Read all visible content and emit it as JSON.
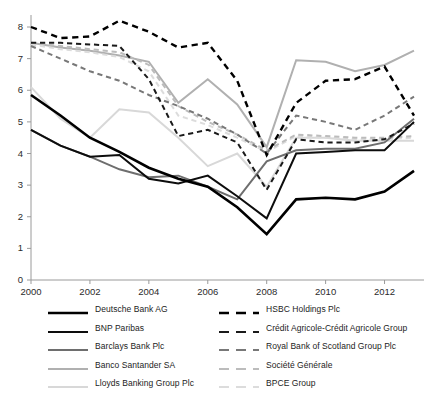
{
  "chart_data": {
    "type": "line",
    "title": "",
    "subtitle": "",
    "xlabel": "",
    "ylabel": "",
    "xlim": [
      2000,
      2013
    ],
    "ylim": [
      0,
      8
    ],
    "x": [
      2000,
      2001,
      2002,
      2003,
      2004,
      2005,
      2006,
      2007,
      2008,
      2009,
      2010,
      2011,
      2012,
      2013
    ],
    "x_ticks": [
      2000,
      2002,
      2004,
      2006,
      2008,
      2010,
      2012
    ],
    "x_tick_labels": [
      "2000",
      "2002",
      "2004",
      "2006",
      "2008",
      "2010",
      "2012"
    ],
    "y_ticks": [
      0,
      1,
      2,
      3,
      4,
      5,
      6,
      7,
      8
    ],
    "y_tick_labels": [
      "0",
      "1",
      "2",
      "3",
      "4",
      "5",
      "6",
      "7",
      "8"
    ],
    "grid": false,
    "legend_position": "below",
    "legend_columns": 2,
    "series": [
      {
        "name": "Deutsche Bank AG",
        "color": "#000000",
        "width": 2.6,
        "dash": "solid",
        "values": [
          5.85,
          5.2,
          4.5,
          4.05,
          3.55,
          3.2,
          2.95,
          2.3,
          1.45,
          2.55,
          2.6,
          2.55,
          2.8,
          3.45
        ]
      },
      {
        "name": "BNP Paribas",
        "color": "#0d0d0d",
        "width": 2.0,
        "dash": "solid",
        "values": [
          4.75,
          4.25,
          3.9,
          3.95,
          3.2,
          3.05,
          3.3,
          2.65,
          1.95,
          4.0,
          4.05,
          4.1,
          4.1,
          5.0
        ]
      },
      {
        "name": "Barclays Bank Plc",
        "color": "#6e6e6e",
        "width": 2.0,
        "dash": "solid",
        "values": [
          4.75,
          4.25,
          3.9,
          3.5,
          3.25,
          3.3,
          2.95,
          2.55,
          3.75,
          4.1,
          4.15,
          4.15,
          4.35,
          5.1
        ]
      },
      {
        "name": "Banco Santander SA",
        "color": "#b0b0b0",
        "width": 2.0,
        "dash": "solid",
        "values": [
          7.5,
          7.35,
          7.25,
          7.1,
          6.9,
          5.6,
          6.35,
          5.55,
          4.2,
          6.95,
          6.9,
          6.6,
          6.8,
          7.25
        ]
      },
      {
        "name": "Lloyds Banking Group Plc",
        "color": "#d8d8d8",
        "width": 2.0,
        "dash": "solid",
        "values": [
          6.1,
          5.1,
          4.5,
          5.4,
          5.3,
          4.5,
          3.6,
          4.0,
          2.95,
          4.5,
          4.5,
          4.4,
          4.4,
          4.4
        ]
      },
      {
        "name": "HSBC Holdings Plc",
        "color": "#000000",
        "width": 2.4,
        "dash": "dashed",
        "values": [
          8.0,
          7.65,
          7.7,
          8.2,
          7.85,
          7.35,
          7.5,
          6.3,
          3.95,
          5.6,
          6.3,
          6.35,
          6.75,
          5.2
        ]
      },
      {
        "name": "Crédit Agricole-Crédit Agricole Group",
        "color": "#1a1a1a",
        "width": 2.0,
        "dash": "dashed",
        "values": [
          7.5,
          7.5,
          7.45,
          7.4,
          6.35,
          4.55,
          4.75,
          4.35,
          2.85,
          4.45,
          4.35,
          4.35,
          4.45,
          4.95
        ]
      },
      {
        "name": "Royal Bank of Scotland Group Plc",
        "color": "#787878",
        "width": 2.0,
        "dash": "dashed",
        "values": [
          7.4,
          7.0,
          6.6,
          6.3,
          5.85,
          5.5,
          5.1,
          4.6,
          4.0,
          5.2,
          5.0,
          4.75,
          5.2,
          5.8
        ]
      },
      {
        "name": "Société Générale",
        "color": "#bcbcbc",
        "width": 2.0,
        "dash": "dashed",
        "values": [
          7.5,
          7.4,
          7.3,
          7.2,
          6.8,
          5.5,
          5.0,
          4.6,
          4.1,
          4.6,
          4.55,
          4.5,
          4.5,
          4.55
        ]
      },
      {
        "name": "BPCE Group",
        "color": "#dcdcdc",
        "width": 2.0,
        "dash": "dashed",
        "values": [
          7.45,
          7.3,
          7.2,
          7.05,
          6.6,
          5.2,
          4.9,
          4.5,
          4.05,
          4.55,
          4.5,
          4.45,
          4.45,
          4.5
        ]
      }
    ]
  },
  "axis": {
    "color": "#9a9a9a",
    "tick_color": "#9a9a9a"
  },
  "legend": {
    "columns": [
      {
        "items": [
          "Deutsche Bank AG",
          "BNP Paribas",
          "Barclays Bank Plc",
          "Banco Santander SA",
          "Lloyds Banking Group Plc"
        ]
      },
      {
        "items": [
          "HSBC Holdings Plc",
          "Crédit Agricole-Crédit Agricole Group",
          "Royal Bank of Scotland Group Plc",
          "Société Générale",
          "BPCE Group"
        ]
      }
    ]
  }
}
